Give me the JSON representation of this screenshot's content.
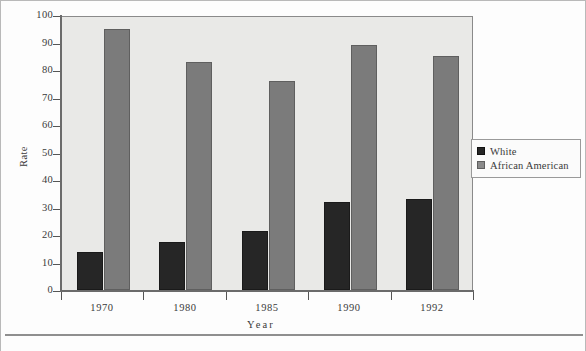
{
  "chart_data": {
    "type": "bar",
    "title": "",
    "xlabel": "Year",
    "ylabel": "Rate",
    "categories": [
      "1970",
      "1980",
      "1985",
      "1990",
      "1992"
    ],
    "series": [
      {
        "name": "White",
        "color": "#262626",
        "values": [
          14,
          17.5,
          21.5,
          32,
          33
        ]
      },
      {
        "name": "African   American",
        "color": "#7b7b7b",
        "values": [
          95,
          83,
          76,
          89,
          85
        ]
      }
    ],
    "ylim": [
      0,
      100
    ],
    "ytick_labels": [
      "100",
      "90",
      "80",
      "70",
      "60",
      "50",
      "40",
      "30",
      "20",
      "10",
      "0"
    ],
    "ytick_values": [
      100,
      90,
      80,
      70,
      60,
      50,
      40,
      30,
      20,
      10,
      0
    ],
    "grid": false,
    "legend_position": "right",
    "plot_background": "#e9e9e7"
  },
  "legend": {
    "items": [
      {
        "label": "White",
        "marker": "legend-swatch-white"
      },
      {
        "label": "African   American",
        "marker": "legend-swatch-african-american"
      }
    ]
  },
  "footer": {
    "caption": ""
  }
}
